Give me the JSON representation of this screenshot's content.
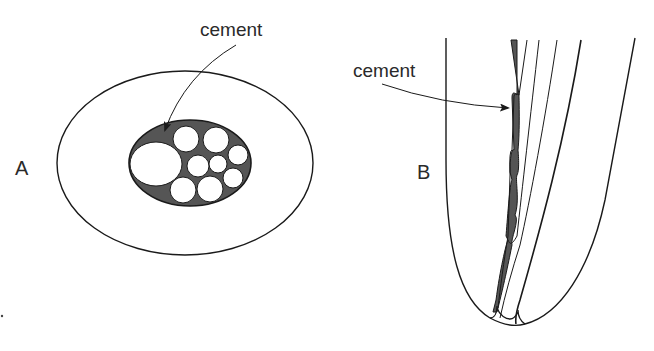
{
  "figure": {
    "panels": [
      {
        "id": "A",
        "letter": "A",
        "description": "Cross-section: outer ellipse containing an inner elliptical bundle of circles with dark cement filling the gaps",
        "callout": {
          "label": "cement"
        }
      },
      {
        "id": "B",
        "letter": "B",
        "description": "Longitudinal section of a tapered U-shaped structure with parallel inner strands; dark cement fills wedge-shaped gaps",
        "callout": {
          "label": "cement"
        }
      }
    ],
    "colors": {
      "line": "#1a1a1a",
      "cement": "#555555",
      "background": "#ffffff",
      "text": "#2a2a2a"
    }
  }
}
